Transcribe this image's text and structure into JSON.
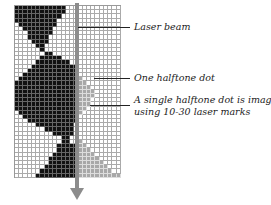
{
  "labels": {
    "laser_beam": "Laser beam",
    "one_dot": "One halftone dot",
    "single_dot_line1": "A single halftone dot is imaged",
    "single_dot_line2": "using 10-30 laser marks"
  },
  "colors": {
    "black_cell": "#111111",
    "gray_cell": "#a8a8a8",
    "beam": "#8c8c8c"
  },
  "grid": {
    "columns": 25,
    "rows": 41,
    "black_runs": [
      [
        0,
        11
      ],
      [
        0,
        11
      ],
      [
        0,
        10
      ],
      [
        0,
        9
      ],
      [
        1,
        9
      ],
      [
        2,
        8
      ],
      [
        3,
        8
      ],
      [
        3,
        7
      ],
      [
        4,
        7
      ],
      [
        5,
        6
      ],
      [
        6,
        6
      ],
      [
        7,
        8
      ],
      [
        6,
        10
      ],
      [
        5,
        12
      ],
      [
        4,
        14
      ],
      [
        3,
        14
      ],
      [
        2,
        14
      ],
      [
        1,
        14
      ],
      [
        0,
        14
      ],
      [
        0,
        14
      ],
      [
        0,
        14
      ],
      [
        0,
        14
      ],
      [
        0,
        14
      ],
      [
        0,
        14
      ],
      [
        0,
        14
      ],
      [
        1,
        14
      ],
      [
        2,
        14
      ],
      [
        3,
        14
      ],
      [
        5,
        13
      ],
      [
        7,
        13
      ],
      [
        9,
        13
      ],
      [
        11,
        12
      ],
      [
        11,
        12
      ],
      [
        10,
        14
      ],
      [
        10,
        14
      ],
      [
        9,
        14
      ],
      [
        8,
        14
      ],
      [
        8,
        14
      ],
      [
        7,
        14
      ],
      [
        6,
        14
      ],
      [
        5,
        14
      ]
    ],
    "gray_runs": [
      null,
      null,
      null,
      null,
      null,
      null,
      null,
      null,
      null,
      null,
      null,
      null,
      null,
      null,
      null,
      null,
      null,
      [
        15,
        15
      ],
      [
        15,
        16
      ],
      [
        15,
        17
      ],
      [
        15,
        18
      ],
      [
        15,
        18
      ],
      [
        15,
        17
      ],
      [
        15,
        17
      ],
      [
        15,
        16
      ],
      [
        15,
        15
      ],
      null,
      null,
      null,
      null,
      null,
      null,
      [
        15,
        15
      ],
      [
        15,
        16
      ],
      [
        15,
        17
      ],
      [
        15,
        18
      ],
      [
        15,
        19
      ],
      [
        15,
        20
      ],
      [
        15,
        21
      ],
      [
        15,
        22
      ],
      [
        15,
        24
      ]
    ]
  }
}
